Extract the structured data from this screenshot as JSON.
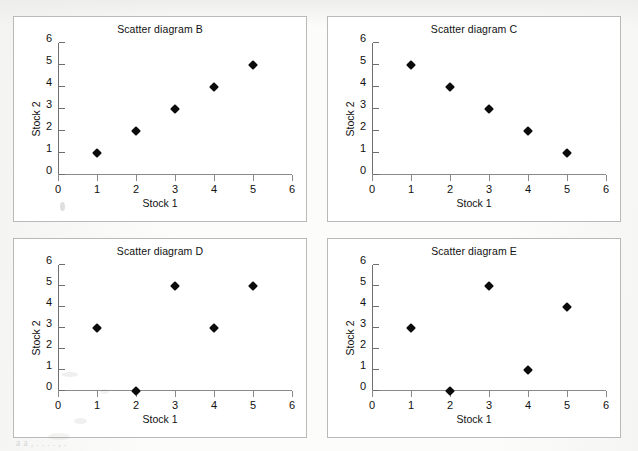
{
  "page": {
    "background_color": "#fcfcfb",
    "panel_border_color": "#b9b9b9",
    "marker_color": "#0b0b0b",
    "axis_color": "#7a7a7a",
    "bleed_text": "a        a   ,     .                  .       .    .  ,    ."
  },
  "charts": [
    {
      "id": "b",
      "type": "scatter",
      "title": "Scatter diagram B",
      "xlabel": "Stock 1",
      "ylabel": "Stock 2",
      "xlim": [
        0,
        6
      ],
      "ylim": [
        0,
        6
      ],
      "xticks": [
        "0",
        "1",
        "2",
        "3",
        "4",
        "5",
        "6"
      ],
      "yticks": [
        "0",
        "1",
        "2",
        "3",
        "4",
        "5",
        "6"
      ],
      "grid": false,
      "legend": null,
      "x": [
        1,
        2,
        3,
        4,
        5
      ],
      "y": [
        1,
        2,
        3,
        4,
        5
      ]
    },
    {
      "id": "c",
      "type": "scatter",
      "title": "Scatter diagram C",
      "xlabel": "Stock 1",
      "ylabel": "Stock 2",
      "xlim": [
        0,
        6
      ],
      "ylim": [
        0,
        6
      ],
      "xticks": [
        "0",
        "1",
        "2",
        "3",
        "4",
        "5",
        "6"
      ],
      "yticks": [
        "0",
        "1",
        "2",
        "3",
        "4",
        "5",
        "6"
      ],
      "grid": false,
      "legend": null,
      "x": [
        1,
        2,
        3,
        4,
        5
      ],
      "y": [
        5,
        4,
        3,
        2,
        1
      ]
    },
    {
      "id": "d",
      "type": "scatter",
      "title": "Scatter diagram D",
      "xlabel": "Stock 1",
      "ylabel": "Stock 2",
      "xlim": [
        0,
        6
      ],
      "ylim": [
        0,
        6
      ],
      "xticks": [
        "0",
        "1",
        "2",
        "3",
        "4",
        "5",
        "6"
      ],
      "yticks": [
        "0",
        "1",
        "2",
        "3",
        "4",
        "5",
        "6"
      ],
      "grid": false,
      "legend": null,
      "x": [
        1,
        2,
        3,
        4,
        5
      ],
      "y": [
        3,
        0,
        5,
        3,
        5
      ]
    },
    {
      "id": "e",
      "type": "scatter",
      "title": "Scatter diagram E",
      "xlabel": "Stock 1",
      "ylabel": "Stock 2",
      "xlim": [
        0,
        6
      ],
      "ylim": [
        0,
        6
      ],
      "xticks": [
        "0",
        "1",
        "2",
        "3",
        "4",
        "5",
        "6"
      ],
      "yticks": [
        "0",
        "1",
        "2",
        "3",
        "4",
        "5",
        "6"
      ],
      "grid": false,
      "legend": null,
      "x": [
        1,
        2,
        3,
        4,
        5
      ],
      "y": [
        3,
        0,
        5,
        1,
        4
      ]
    }
  ],
  "chart_data": [
    {
      "type": "scatter",
      "title": "Scatter diagram B",
      "xlabel": "Stock 1",
      "ylabel": "Stock 2",
      "xlim": [
        0,
        6
      ],
      "ylim": [
        0,
        6
      ],
      "grid": false,
      "points": [
        [
          1,
          1
        ],
        [
          2,
          2
        ],
        [
          3,
          3
        ],
        [
          4,
          4
        ],
        [
          5,
          5
        ]
      ]
    },
    {
      "type": "scatter",
      "title": "Scatter diagram C",
      "xlabel": "Stock 1",
      "ylabel": "Stock 2",
      "xlim": [
        0,
        6
      ],
      "ylim": [
        0,
        6
      ],
      "grid": false,
      "points": [
        [
          1,
          5
        ],
        [
          2,
          4
        ],
        [
          3,
          3
        ],
        [
          4,
          2
        ],
        [
          5,
          1
        ]
      ]
    },
    {
      "type": "scatter",
      "title": "Scatter diagram D",
      "xlabel": "Stock 1",
      "ylabel": "Stock 2",
      "xlim": [
        0,
        6
      ],
      "ylim": [
        0,
        6
      ],
      "grid": false,
      "points": [
        [
          1,
          3
        ],
        [
          2,
          0
        ],
        [
          3,
          5
        ],
        [
          4,
          3
        ],
        [
          5,
          5
        ]
      ]
    },
    {
      "type": "scatter",
      "title": "Scatter diagram E",
      "xlabel": "Stock 1",
      "ylabel": "Stock 2",
      "xlim": [
        0,
        6
      ],
      "ylim": [
        0,
        6
      ],
      "grid": false,
      "points": [
        [
          1,
          3
        ],
        [
          2,
          0
        ],
        [
          3,
          5
        ],
        [
          4,
          1
        ],
        [
          5,
          4
        ]
      ]
    }
  ]
}
